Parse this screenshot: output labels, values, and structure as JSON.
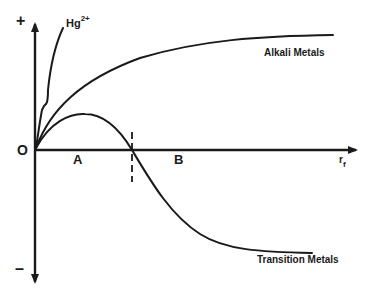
{
  "diagram": {
    "axes": {
      "y_positive_label": "+",
      "y_negative_label": "–",
      "origin_label": "O",
      "x_label": "r",
      "x_label_subscript": "f"
    },
    "regions": [
      {
        "label": "A"
      },
      {
        "label": "B"
      }
    ],
    "curves": [
      {
        "name": "hg",
        "label_base": "Hg",
        "label_superscript": "2+"
      },
      {
        "name": "alkali",
        "label": "Alkali Metals"
      },
      {
        "name": "transition",
        "label": "Transition Metals"
      }
    ],
    "colors": {
      "ink": "#1a1a1a",
      "background": "#ffffff"
    }
  }
}
